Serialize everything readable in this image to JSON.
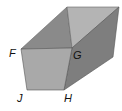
{
  "diagram": {
    "type": "trapezoidal-prism",
    "vertex_labels": {
      "F": "F",
      "G": "G",
      "H": "H",
      "J": "J"
    },
    "colors": {
      "front_face": "#a9a9a9",
      "top_left_face": "#8a8a8a",
      "top_right_face": "#b4b4b4",
      "right_face": "#7e7e7e",
      "edge": "#555555",
      "background": "#ffffff"
    }
  }
}
